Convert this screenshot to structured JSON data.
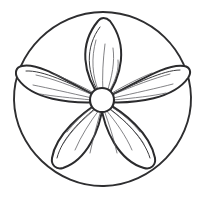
{
  "artwork": {
    "title": "Five-petal flower in circle",
    "subject": "flower-mandala",
    "style": "black-and-white line drawing",
    "background_color": "#ffffff",
    "line_color": "#2b2b2d",
    "vein_color": "#5a5a5e",
    "canvas": {
      "width": 207,
      "height": 197
    },
    "outer_circle": {
      "label": "outer circle",
      "center_x": 103,
      "center_y": 99,
      "radius": 87,
      "stroke_width": 1.9
    },
    "center_disc": {
      "label": "flower center",
      "center_x": 102,
      "center_y": 100,
      "radius": 12,
      "stroke_width": 2.1
    },
    "petal_count": 5,
    "petals": [
      {
        "name": "top-petal",
        "angle_deg": -88,
        "tip_x": 104,
        "tip_y": 19,
        "length": 81,
        "half_width": 25,
        "vein_count": 4
      },
      {
        "name": "upper-right-petal",
        "angle_deg": -18,
        "tip_x": 185,
        "tip_y": 73,
        "length": 85,
        "half_width": 24,
        "vein_count": 4
      },
      {
        "name": "lower-right-petal",
        "angle_deg": 62,
        "tip_x": 143,
        "tip_y": 175,
        "length": 82,
        "half_width": 24,
        "vein_count": 4
      },
      {
        "name": "lower-left-petal",
        "angle_deg": 118,
        "tip_x": 62,
        "tip_y": 174,
        "length": 82,
        "half_width": 24,
        "vein_count": 4
      },
      {
        "name": "upper-left-petal",
        "angle_deg": 197,
        "tip_x": 20,
        "tip_y": 75,
        "length": 85,
        "half_width": 24,
        "vein_count": 4
      }
    ]
  }
}
